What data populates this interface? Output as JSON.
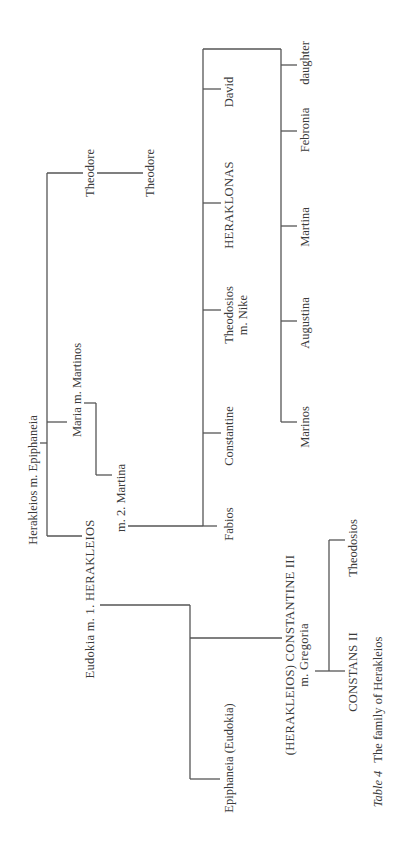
{
  "diagram": {
    "type": "family-tree",
    "orientation": "rotated-90-ccw",
    "line_color": "#555555",
    "text_color": "#3a3a3a",
    "nodes": {
      "root": "Herakleios m. Epiphaneia",
      "theodore_1": "Theodore",
      "theodore_2": "Theodore",
      "maria": "Maria m. Martinos",
      "martina_spouse": "m. 2. Martina",
      "herakleios": "Eudokia m. 1. HERAKLEIOS",
      "fabios": "Fabios",
      "constantine": "Constantine",
      "theodosios_line1": "Theodosios",
      "theodosios_line2": "m. Nike",
      "heraklonas": "HERAKLONAS",
      "david": "David",
      "marinos": "Marinos",
      "augustina": "Augustina",
      "martina_daughter": "Martina",
      "febronia": "Febronia",
      "daughter": "daughter",
      "constantine_iii_line1": "(HERAKLEIOS) CONSTANTINE III",
      "constantine_iii_line2": "m. Gregoria",
      "epiphaneia": "Epiphaneia (Eudokia)",
      "constans_ii": "CONSTANS II",
      "theodosios_son": "Theodosios"
    },
    "edges": [
      [
        "root",
        "theodore_1"
      ],
      [
        "theodore_1",
        "theodore_2"
      ],
      [
        "root",
        "maria"
      ],
      [
        "root",
        "herakleios"
      ],
      [
        "maria",
        "martina_spouse"
      ],
      [
        "martina_spouse",
        "fabios"
      ],
      [
        "martina_spouse",
        "constantine"
      ],
      [
        "martina_spouse",
        "theodosios_line1"
      ],
      [
        "martina_spouse",
        "heraklonas"
      ],
      [
        "martina_spouse",
        "david"
      ],
      [
        "martina_spouse",
        "marinos"
      ],
      [
        "martina_spouse",
        "augustina"
      ],
      [
        "martina_spouse",
        "martina_daughter"
      ],
      [
        "martina_spouse",
        "febronia"
      ],
      [
        "martina_spouse",
        "daughter"
      ],
      [
        "herakleios",
        "constantine_iii_line1"
      ],
      [
        "herakleios",
        "epiphaneia"
      ],
      [
        "constantine_iii_line1",
        "constans_ii"
      ],
      [
        "constantine_iii_line1",
        "theodosios_son"
      ]
    ]
  },
  "caption": {
    "label": "Table 4",
    "text": "The family of Herakleios"
  }
}
